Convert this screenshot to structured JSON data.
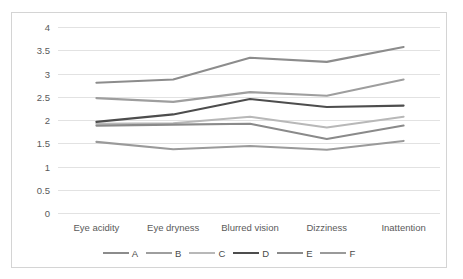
{
  "chart_data": {
    "type": "line",
    "title": "",
    "xlabel": "",
    "ylabel": "",
    "categories": [
      "Eye acidity",
      "Eye dryness",
      "Blurred vision",
      "Dizziness",
      "Inattention"
    ],
    "ylim": [
      0,
      4
    ],
    "ytick_labels": [
      "0",
      "0.5",
      "1",
      "1.5",
      "2",
      "2.5",
      "3",
      "3.5",
      "4"
    ],
    "ytick_values": [
      0,
      0.5,
      1,
      1.5,
      2,
      2.5,
      3,
      3.5,
      4
    ],
    "grid": true,
    "legend_position": "bottom",
    "series": [
      {
        "name": "A",
        "color": "#8c8c8c",
        "values": [
          2.8,
          2.87,
          3.34,
          3.25,
          3.57
        ]
      },
      {
        "name": "B",
        "color": "#9e9e9e",
        "values": [
          2.47,
          2.39,
          2.6,
          2.52,
          2.87
        ]
      },
      {
        "name": "C",
        "color": "#b8b8b8",
        "values": [
          1.92,
          1.93,
          2.07,
          1.84,
          2.07
        ]
      },
      {
        "name": "D",
        "color": "#4d4d4d",
        "values": [
          1.96,
          2.12,
          2.45,
          2.28,
          2.31
        ]
      },
      {
        "name": "E",
        "color": "#8a8a8a",
        "values": [
          1.88,
          1.9,
          1.92,
          1.59,
          1.88
        ]
      },
      {
        "name": "F",
        "color": "#9a9a9a",
        "values": [
          1.53,
          1.37,
          1.44,
          1.36,
          1.55
        ]
      }
    ]
  }
}
